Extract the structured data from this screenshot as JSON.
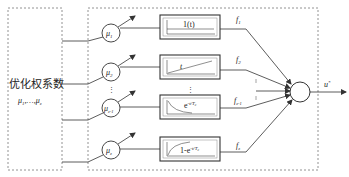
{
  "optimizer": {
    "title": "优化权系数",
    "weights_label": "μ",
    "weights_sub1": "1",
    "weights_mid": ",…,",
    "weights_sub2": "z"
  },
  "weights": [
    {
      "symbol": "μ",
      "sub": "1"
    },
    {
      "symbol": "μ",
      "sub": "2"
    },
    {
      "symbol": "μ",
      "sub": "z-1"
    },
    {
      "symbol": "μ",
      "sub": "z"
    }
  ],
  "blocks": [
    {
      "label": "1(t)",
      "curve": "step"
    },
    {
      "label": "t",
      "curve": "ramp"
    },
    {
      "label_base": "e",
      "label_exp": "-t/T",
      "label_exp_sub": "c",
      "curve": "decay"
    },
    {
      "label_base": "1-e",
      "label_exp": "-t/T",
      "label_exp_sub": "c",
      "curve": "rise"
    }
  ],
  "outputs": [
    {
      "symbol": "f",
      "sub": "1"
    },
    {
      "symbol": "f",
      "sub": "2"
    },
    {
      "symbol": "f",
      "sub": "z-1"
    },
    {
      "symbol": "f",
      "sub": "z"
    }
  ],
  "ellipsis": "⋮",
  "summer_output": {
    "symbol": "u",
    "sup": "*"
  },
  "colors": {
    "line": "#333333",
    "dashed": "#777777",
    "text": "#222222"
  }
}
